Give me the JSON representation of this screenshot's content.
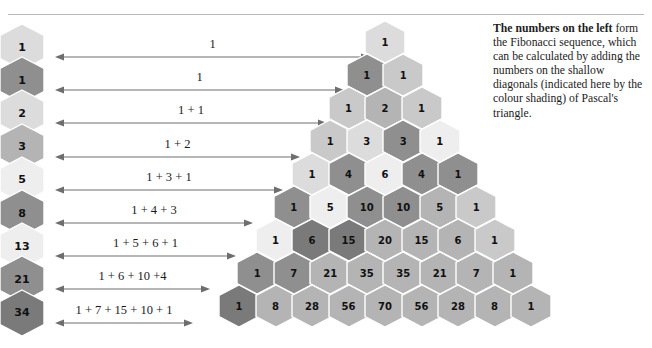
{
  "caption": {
    "lead": "The numbers on the left",
    "body": " form the Fibonacci sequence, which can be calculated by adding the numbers on the shallow diagonals (indicated here by the colour shading) of Pascal's triangle."
  },
  "colors": {
    "very_light": "#eeeeee",
    "light": "#dcdcdc",
    "mid_light": "#c9c9c9",
    "mid": "#b4b4b4",
    "dark": "#8f8f8f",
    "darker": "#7a7a7a",
    "stroke": "#ffffff",
    "rule": "#b9b9b9",
    "arrow": "#6e6e6e",
    "text": "#111111"
  },
  "fibonacci_column": {
    "items": [
      {
        "value": "1",
        "shade": "light"
      },
      {
        "value": "1",
        "shade": "dark"
      },
      {
        "value": "2",
        "shade": "light"
      },
      {
        "value": "3",
        "shade": "mid"
      },
      {
        "value": "5",
        "shade": "very_light"
      },
      {
        "value": "8",
        "shade": "dark"
      },
      {
        "value": "13",
        "shade": "very_light"
      },
      {
        "value": "21",
        "shade": "dark"
      },
      {
        "value": "34",
        "shade": "darker"
      }
    ]
  },
  "arrows": {
    "rows": [
      {
        "label": "1",
        "x": 55,
        "width": 315
      },
      {
        "label": "1",
        "x": 55,
        "width": 289
      },
      {
        "label": "1 + 1",
        "x": 55,
        "width": 272
      },
      {
        "label": "1 + 2",
        "x": 55,
        "width": 245
      },
      {
        "label": "1 + 3 + 1",
        "x": 55,
        "width": 228
      },
      {
        "label": "1 + 4 + 3",
        "x": 55,
        "width": 198
      },
      {
        "label": "1 + 5 + 6 + 1",
        "x": 55,
        "width": 181
      },
      {
        "label": "1 + 6 + 10 +4",
        "x": 55,
        "width": 155
      },
      {
        "label": "1 + 7 + 15 + 10 + 1",
        "x": 55,
        "width": 138
      }
    ]
  },
  "chart_data": {
    "type": "table",
    "rows": [
      {
        "row": 0,
        "values": [
          "1"
        ],
        "shades": [
          "light"
        ]
      },
      {
        "row": 1,
        "values": [
          "1",
          "1"
        ],
        "shades": [
          "dark",
          "mid_light"
        ]
      },
      {
        "row": 2,
        "values": [
          "1",
          "2",
          "1"
        ],
        "shades": [
          "mid_light",
          "mid",
          "mid_light"
        ]
      },
      {
        "row": 3,
        "values": [
          "1",
          "3",
          "3",
          "1"
        ],
        "shades": [
          "mid_light",
          "light",
          "dark",
          "very_light"
        ]
      },
      {
        "row": 4,
        "values": [
          "1",
          "4",
          "6",
          "4",
          "1"
        ],
        "shades": [
          "light",
          "dark",
          "very_light",
          "dark",
          "dark"
        ]
      },
      {
        "row": 5,
        "values": [
          "1",
          "5",
          "10",
          "10",
          "5",
          "1"
        ],
        "shades": [
          "dark",
          "very_light",
          "dark",
          "dark",
          "mid",
          "mid_light"
        ]
      },
      {
        "row": 6,
        "values": [
          "1",
          "6",
          "15",
          "20",
          "15",
          "6",
          "1"
        ],
        "shades": [
          "very_light",
          "darker",
          "darker",
          "mid",
          "mid",
          "mid",
          "mid_light"
        ]
      },
      {
        "row": 7,
        "values": [
          "1",
          "7",
          "21",
          "35",
          "35",
          "21",
          "7",
          "1"
        ],
        "shades": [
          "dark",
          "dark",
          "mid",
          "mid",
          "mid",
          "mid",
          "mid",
          "mid"
        ]
      },
      {
        "row": 8,
        "values": [
          "1",
          "8",
          "28",
          "56",
          "70",
          "56",
          "28",
          "8",
          "1"
        ],
        "shades": [
          "darker",
          "mid",
          "mid",
          "mid",
          "mid",
          "mid",
          "mid",
          "mid",
          "mid"
        ]
      }
    ],
    "geometry": {
      "apex_x": 385,
      "apex_y": 42,
      "dx": 36.5,
      "dy": 33,
      "hex_w": 40,
      "hex_h": 42
    }
  }
}
